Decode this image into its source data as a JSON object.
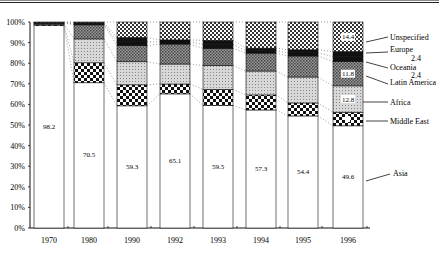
{
  "chart_data": {
    "type": "bar",
    "stacked": true,
    "percent_stacked": true,
    "title": "",
    "xlabel": "",
    "ylabel": "",
    "ylim": [
      0,
      100
    ],
    "y_ticks": [
      "0%",
      "10%",
      "20%",
      "30%",
      "40%",
      "50%",
      "60%",
      "70%",
      "80%",
      "90%",
      "100%"
    ],
    "grid": false,
    "legend_position": "right (callout labels attached to 1996 bar)",
    "categories": [
      "1970",
      "1980",
      "1990",
      "1992",
      "1993",
      "1994",
      "1995",
      "1996"
    ],
    "series": [
      {
        "name": "Asia",
        "pattern": "white",
        "values": [
          98.2,
          70.5,
          59.3,
          65.1,
          59.5,
          57.3,
          54.4,
          49.6
        ]
      },
      {
        "name": "Middle East",
        "pattern": "checker-coarse",
        "values": [
          0.6,
          9.7,
          10.2,
          4.8,
          7.8,
          7.3,
          6.3,
          6.6
        ]
      },
      {
        "name": "Africa",
        "pattern": "light-gray",
        "values": [
          0.3,
          11.6,
          11.2,
          9.7,
          11.6,
          11.6,
          12.6,
          12.8
        ]
      },
      {
        "name": "Latin America",
        "pattern": "dense-gray",
        "values": [
          0.4,
          6.8,
          7.8,
          9.7,
          8.3,
          8.7,
          10.2,
          11.8
        ]
      },
      {
        "name": "Oceania",
        "pattern": "black",
        "values": [
          0.1,
          0.5,
          1.9,
          1.0,
          1.9,
          1.2,
          1.5,
          2.4
        ]
      },
      {
        "name": "Europe",
        "pattern": "black",
        "values": [
          0.2,
          0.5,
          2.0,
          1.0,
          2.0,
          1.2,
          1.5,
          2.4
        ]
      },
      {
        "name": "Unspecified",
        "pattern": "checker-fine",
        "values": [
          0.2,
          0.4,
          7.6,
          8.7,
          8.9,
          12.7,
          13.5,
          14.4
        ]
      }
    ],
    "data_labels": {
      "Asia": [
        "98.2",
        "70.5",
        "59.3",
        "65.1",
        "59.5",
        "57.3",
        "54.4",
        "49.6"
      ],
      "1996": {
        "Unspecified": "14.4",
        "Europe": "2.4",
        "Oceania": "2.4",
        "Latin America": "11.8",
        "Africa": "12.8"
      }
    },
    "annotations": [
      "Dotted connector lines join matching segment boundaries between adjacent bars"
    ]
  },
  "axis": {
    "y_labels": [
      "100%",
      "90%",
      "80%",
      "70%",
      "60%",
      "50%",
      "40%",
      "30%",
      "20%",
      "10%",
      "0%"
    ]
  },
  "legend": {
    "unspecified": "Unspecified",
    "europe": "Europe",
    "europe_value": "2.4",
    "oceania": "Oceania",
    "oceania_value": "2.4",
    "latin_america": "Latin America",
    "africa": "Africa",
    "middle_east": "Middle East",
    "asia": "Asia"
  },
  "bar_labels_1996": {
    "unspecified": "14.4",
    "latin_america": "11.8",
    "africa": "12.8"
  }
}
